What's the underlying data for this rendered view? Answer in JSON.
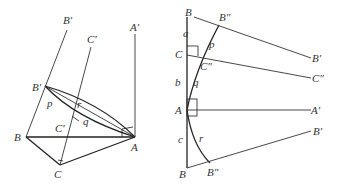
{
  "left_figure": {
    "labels": {
      "B_prime_top": "B′",
      "C_prime_top": "C′",
      "A_prime_top": "A′",
      "B_prime_vertex": "B′",
      "p": "p",
      "r": "r",
      "q": "q",
      "C_prime_vertex": "C′",
      "B": "B",
      "A": "A",
      "C": "C"
    }
  },
  "right_figure": {
    "labels": {
      "B_top": "B",
      "B_double_prime_top": "B″",
      "a": "a",
      "p": "p",
      "C": "C",
      "C_double_prime": "C″",
      "B_prime_right_top": "B′",
      "C_double_prime_right": "C″",
      "b": "b",
      "q": "q",
      "A": "A",
      "A_prime_right": "A′",
      "B_prime_right_bottom": "B′",
      "c": "c",
      "r": "r",
      "B_bottom": "B",
      "B_double_prime_bottom": "B″"
    }
  },
  "colors": {
    "stroke": "#333333",
    "background": "#ffffff"
  }
}
